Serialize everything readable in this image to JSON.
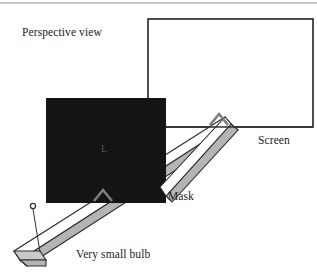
{
  "figure": {
    "title_label": "Perspective view",
    "canvas": {
      "width": 317,
      "height": 276,
      "background": "#ffffff"
    },
    "labels": {
      "perspective_view": "Perspective view",
      "screen": "Screen",
      "mask": "Mask",
      "very_small_bulb": "Very small bulb",
      "mask_inner_marking": "L"
    },
    "colors": {
      "ink": "#1c1c1c",
      "outline": "#3a3a3a",
      "mask_fill": "#141414",
      "beam_top_fill": "#ffffff",
      "beam_side_fill": "#b4b4b4",
      "beam_cap_fill": "#c9c9c9",
      "chevron": "#7d7d7d",
      "scan_line": "#9a9a9a",
      "mask_inner_text": "#5a5a5a"
    },
    "elements": [
      {
        "name": "screen",
        "kind": "rectangle-outline",
        "label": "Screen",
        "geometry": {
          "x": 148,
          "y": 19,
          "width": 165,
          "height": 108
        }
      },
      {
        "name": "mask",
        "kind": "filled-rectangle",
        "label": "Mask",
        "marking": "L",
        "geometry": {
          "x": 46,
          "y": 98,
          "width": 120,
          "height": 105
        }
      },
      {
        "name": "light-beam",
        "kind": "rectangular-prism",
        "description": "beam of light travelling from the bulb up to the right through the mask aperture onto the screen"
      },
      {
        "name": "bulb",
        "kind": "small-circle",
        "label": "Very small bulb",
        "geometry": {
          "cx": 33,
          "cy": 206,
          "r": 2.6
        }
      },
      {
        "name": "bulb-leader-line",
        "kind": "line",
        "geometry": {
          "x1": 33,
          "y1": 209,
          "x2": 46,
          "y2": 251
        }
      },
      {
        "name": "mask-aperture-chevron",
        "kind": "chevron",
        "geometry": {
          "apex_x": 103,
          "apex_y": 191
        }
      },
      {
        "name": "screen-spot-chevron",
        "kind": "chevron",
        "geometry": {
          "apex_x": 219,
          "apex_y": 114
        }
      },
      {
        "name": "scan-artifact-line",
        "kind": "horizontal-rule",
        "geometry": {
          "x1": 0,
          "y1": 3,
          "x2": 317,
          "y2": 3
        }
      }
    ],
    "label_positions": {
      "perspective_view": {
        "x": 22,
        "y": 35
      },
      "screen": {
        "x": 258,
        "y": 143
      },
      "mask": {
        "x": 168,
        "y": 199
      },
      "very_small_bulb": {
        "x": 76,
        "y": 257
      },
      "mask_inner_marking": {
        "x": 101,
        "y": 152
      }
    }
  }
}
